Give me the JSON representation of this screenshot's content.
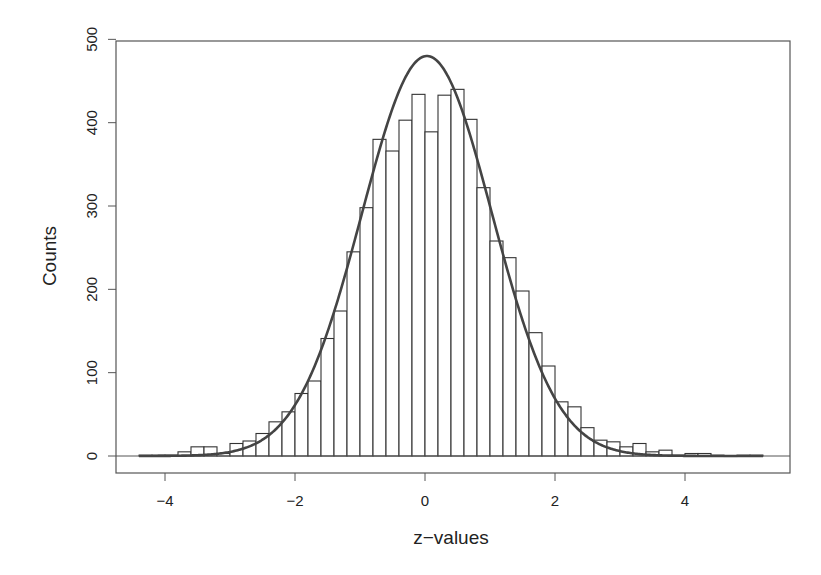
{
  "chart_data": {
    "type": "bar",
    "subtype": "histogram-with-density-curve",
    "title": "",
    "xlabel": "z−values",
    "ylabel": "Counts",
    "xlim": [
      -4.6,
      5.6
    ],
    "ylim": [
      -20,
      500
    ],
    "xticks": [
      -4,
      -2,
      0,
      2,
      4
    ],
    "xtick_labels": [
      "−4",
      "−2",
      "0",
      "2",
      "4"
    ],
    "yticks": [
      0,
      100,
      200,
      300,
      400,
      500
    ],
    "ytick_labels": [
      "0",
      "100",
      "200",
      "300",
      "400",
      "500"
    ],
    "grid": false,
    "legend": null,
    "bin_width": 0.2,
    "bin_start": -4.4,
    "bins": [
      {
        "x0": -4.4,
        "x1": -4.2,
        "count": 1
      },
      {
        "x0": -4.2,
        "x1": -4.0,
        "count": 1
      },
      {
        "x0": -4.0,
        "x1": -3.8,
        "count": 1
      },
      {
        "x0": -3.8,
        "x1": -3.6,
        "count": 5
      },
      {
        "x0": -3.6,
        "x1": -3.4,
        "count": 11
      },
      {
        "x0": -3.4,
        "x1": -3.2,
        "count": 11
      },
      {
        "x0": -3.2,
        "x1": -3.0,
        "count": 3
      },
      {
        "x0": -3.0,
        "x1": -2.8,
        "count": 15
      },
      {
        "x0": -2.8,
        "x1": -2.6,
        "count": 18
      },
      {
        "x0": -2.6,
        "x1": -2.4,
        "count": 27
      },
      {
        "x0": -2.4,
        "x1": -2.2,
        "count": 41
      },
      {
        "x0": -2.2,
        "x1": -2.0,
        "count": 53
      },
      {
        "x0": -2.0,
        "x1": -1.8,
        "count": 75
      },
      {
        "x0": -1.8,
        "x1": -1.6,
        "count": 90
      },
      {
        "x0": -1.6,
        "x1": -1.4,
        "count": 141
      },
      {
        "x0": -1.4,
        "x1": -1.2,
        "count": 174
      },
      {
        "x0": -1.2,
        "x1": -1.0,
        "count": 245
      },
      {
        "x0": -1.0,
        "x1": -0.8,
        "count": 298
      },
      {
        "x0": -0.8,
        "x1": -0.6,
        "count": 380
      },
      {
        "x0": -0.6,
        "x1": -0.4,
        "count": 366
      },
      {
        "x0": -0.4,
        "x1": -0.2,
        "count": 403
      },
      {
        "x0": -0.2,
        "x1": 0.0,
        "count": 434
      },
      {
        "x0": 0.0,
        "x1": 0.2,
        "count": 389
      },
      {
        "x0": 0.2,
        "x1": 0.4,
        "count": 433
      },
      {
        "x0": 0.4,
        "x1": 0.6,
        "count": 440
      },
      {
        "x0": 0.6,
        "x1": 0.8,
        "count": 404
      },
      {
        "x0": 0.8,
        "x1": 1.0,
        "count": 322
      },
      {
        "x0": 1.0,
        "x1": 1.2,
        "count": 258
      },
      {
        "x0": 1.2,
        "x1": 1.4,
        "count": 238
      },
      {
        "x0": 1.4,
        "x1": 1.6,
        "count": 198
      },
      {
        "x0": 1.6,
        "x1": 1.8,
        "count": 148
      },
      {
        "x0": 1.8,
        "x1": 2.0,
        "count": 108
      },
      {
        "x0": 2.0,
        "x1": 2.2,
        "count": 65
      },
      {
        "x0": 2.2,
        "x1": 2.4,
        "count": 59
      },
      {
        "x0": 2.4,
        "x1": 2.6,
        "count": 34
      },
      {
        "x0": 2.6,
        "x1": 2.8,
        "count": 19
      },
      {
        "x0": 2.8,
        "x1": 3.0,
        "count": 17
      },
      {
        "x0": 3.0,
        "x1": 3.2,
        "count": 11
      },
      {
        "x0": 3.2,
        "x1": 3.4,
        "count": 15
      },
      {
        "x0": 3.4,
        "x1": 3.6,
        "count": 5
      },
      {
        "x0": 3.6,
        "x1": 3.8,
        "count": 7
      },
      {
        "x0": 3.8,
        "x1": 4.0,
        "count": 1
      },
      {
        "x0": 4.0,
        "x1": 4.2,
        "count": 3
      },
      {
        "x0": 4.2,
        "x1": 4.4,
        "count": 3
      },
      {
        "x0": 4.4,
        "x1": 4.6,
        "count": 1
      },
      {
        "x0": 4.6,
        "x1": 4.8,
        "count": 0
      },
      {
        "x0": 4.8,
        "x1": 5.0,
        "count": 1
      },
      {
        "x0": 5.0,
        "x1": 5.2,
        "count": 1
      }
    ],
    "categories": [
      "-4.3",
      "-4.1",
      "-3.9",
      "-3.7",
      "-3.5",
      "-3.3",
      "-3.1",
      "-2.9",
      "-2.7",
      "-2.5",
      "-2.3",
      "-2.1",
      "-1.9",
      "-1.7",
      "-1.5",
      "-1.3",
      "-1.1",
      "-0.9",
      "-0.7",
      "-0.5",
      "-0.3",
      "-0.1",
      "0.1",
      "0.3",
      "0.5",
      "0.7",
      "0.9",
      "1.1",
      "1.3",
      "1.5",
      "1.7",
      "1.9",
      "2.1",
      "2.3",
      "2.5",
      "2.7",
      "2.9",
      "3.1",
      "3.3",
      "3.5",
      "3.7",
      "3.9",
      "4.1",
      "4.3",
      "4.5",
      "4.7",
      "4.9",
      "5.1"
    ],
    "values": [
      1,
      1,
      1,
      5,
      11,
      11,
      3,
      15,
      18,
      27,
      41,
      53,
      75,
      90,
      141,
      174,
      245,
      298,
      380,
      366,
      403,
      434,
      389,
      433,
      440,
      404,
      322,
      258,
      238,
      198,
      148,
      108,
      65,
      59,
      34,
      19,
      17,
      11,
      15,
      5,
      7,
      1,
      3,
      3,
      1,
      0,
      1,
      1
    ],
    "density_curve": {
      "type": "normal",
      "mean": 0.03,
      "sd": 1.0,
      "peak_count": 480,
      "x_range": [
        -4.4,
        5.2
      ],
      "color": "#444444"
    },
    "colors": {
      "bar_fill": "#ffffff",
      "bar_stroke": "#333333",
      "axis": "#555555",
      "curve": "#444444",
      "text": "#222222"
    }
  }
}
